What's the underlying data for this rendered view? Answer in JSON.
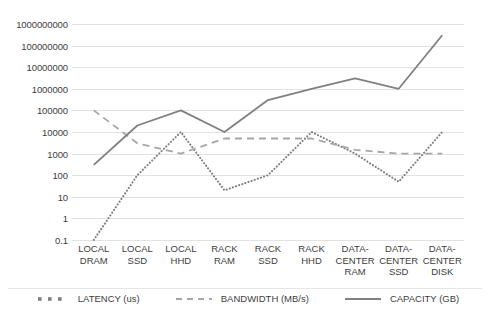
{
  "chart_data": {
    "type": "line",
    "title": "",
    "subtitle": "",
    "xlabel": "",
    "ylabel": "",
    "yscale": "log",
    "ylim": [
      0.1,
      1000000000
    ],
    "grid": true,
    "legend_position": "bottom",
    "categories": [
      "LOCAL\nDRAM",
      "LOCAL\nSSD",
      "LOCAL\nHHD",
      "RACK\nRAM",
      "RACK\nSSD",
      "RACK\nHHD",
      "DATA-\nCENTER\nRAM",
      "DATA-\nCENTER\nSSD",
      "DATA-\nCENTER\nDISK"
    ],
    "y_ticks": [
      "1000000000",
      "100000000",
      "10000000",
      "1000000",
      "100000",
      "10000",
      "1000",
      "100",
      "10",
      "1",
      "0.1"
    ],
    "y_tick_values": [
      1000000000,
      100000000,
      10000000,
      1000000,
      100000,
      10000,
      1000,
      100,
      10,
      1,
      0.1
    ],
    "series": [
      {
        "name": "LATENCY (us)",
        "style": "dotted",
        "color": "#7f7f7f",
        "values": [
          0.1,
          100,
          10000,
          20,
          100,
          10000,
          1000,
          50,
          10000
        ]
      },
      {
        "name": "BANDWIDTH (MB/s)",
        "style": "dashed",
        "color": "#a6a6a6",
        "values": [
          100000,
          3000,
          1000,
          5000,
          5000,
          5000,
          1500,
          1000,
          1000
        ]
      },
      {
        "name": "CAPACITY (GB)",
        "style": "solid",
        "color": "#808080",
        "values": [
          300,
          20000,
          100000,
          10000,
          300000,
          1000000,
          3000000,
          1000000,
          300000000
        ]
      }
    ]
  },
  "legend": {
    "items": [
      {
        "label": "LATENCY (us)",
        "icon": "dotted-line-swatch"
      },
      {
        "label": "BANDWIDTH (MB/s)",
        "icon": "dashed-line-swatch"
      },
      {
        "label": "CAPACITY (GB)",
        "icon": "solid-line-swatch"
      }
    ]
  },
  "colors": {
    "gridline": "#e2e2e2",
    "text": "#3d3d3d",
    "background": "#ffffff"
  }
}
